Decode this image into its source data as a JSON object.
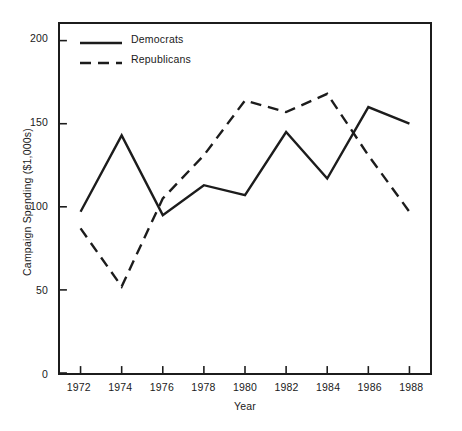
{
  "chart_data": {
    "type": "line",
    "title": "",
    "xlabel": "Year",
    "ylabel": "Campaign Spending ($1,000s)",
    "x": [
      1972,
      1974,
      1976,
      1978,
      1980,
      1982,
      1984,
      1986,
      1988
    ],
    "xtick_labels": [
      "1972",
      "1974",
      "1976",
      "1978",
      "1980",
      "1982",
      "1984",
      "1986",
      "1988"
    ],
    "ytick_labels": [
      "0",
      "50",
      "100",
      "150",
      "200"
    ],
    "yticks": [
      0,
      50,
      100,
      150,
      200
    ],
    "xlim": [
      1971,
      1989
    ],
    "ylim": [
      0,
      210
    ],
    "grid": false,
    "legend_position": "upper-left-inside",
    "series": [
      {
        "name": "Democrats",
        "style": "solid",
        "color": "#1c1c1c",
        "values": [
          97,
          143,
          95,
          113,
          107,
          145,
          117,
          160,
          150
        ]
      },
      {
        "name": "Republicans",
        "style": "dashed",
        "color": "#1c1c1c",
        "values": [
          87,
          52,
          105,
          131,
          164,
          157,
          168,
          131,
          97
        ]
      }
    ]
  },
  "legend": {
    "items": [
      {
        "label": "Democrats",
        "style": "solid"
      },
      {
        "label": "Republicans",
        "style": "dashed"
      }
    ]
  },
  "axes": {
    "y_title": "Campaign Spending ($1,000s)",
    "x_title": "Year"
  },
  "caption": ""
}
